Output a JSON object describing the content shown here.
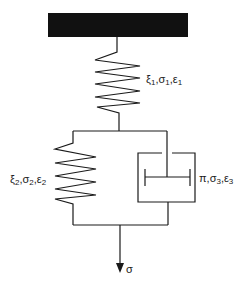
{
  "diagram": {
    "type": "rheological-model",
    "colors": {
      "stroke": "#1a1a1a",
      "ground": "#111111",
      "background": "#ffffff"
    },
    "ground": {
      "x": 48,
      "y": 13,
      "width": 140,
      "height": 24
    },
    "elements": {
      "top_spring": {
        "label": "ξ1,σ1,ε1",
        "parts": [
          "ξ",
          "1",
          ",σ",
          "1",
          ",ε",
          "1"
        ]
      },
      "parallel_spring": {
        "label": "ξ2,σ2,ε2",
        "parts": [
          "ξ",
          "2",
          ",σ",
          "2",
          ",ε",
          "2"
        ]
      },
      "dashpot": {
        "label": "π,σ3,ε3",
        "parts": [
          "π,σ",
          "3",
          ",ε",
          "3"
        ]
      },
      "output": {
        "label": "σ"
      }
    }
  }
}
